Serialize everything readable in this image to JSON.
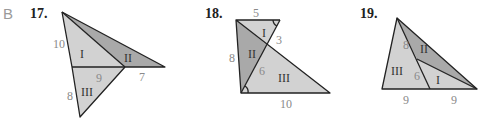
{
  "section_letter": "B",
  "problems": [
    {
      "number": "17.",
      "regions": [
        "I",
        "II",
        "III"
      ],
      "side_labels": [
        "10",
        "9",
        "7",
        "8"
      ]
    },
    {
      "number": "18.",
      "regions": [
        "I",
        "II",
        "III"
      ],
      "side_labels": [
        "5",
        "3",
        "8",
        "6",
        "10"
      ]
    },
    {
      "number": "19.",
      "regions": [
        "I",
        "II",
        "III"
      ],
      "side_labels": [
        "8",
        "6",
        "9",
        "9"
      ]
    }
  ],
  "colors": {
    "light_fill": "#d2d2d2",
    "dark_fill": "#a9a9a9",
    "label": "#8a8a8a",
    "edge": "#222222"
  }
}
